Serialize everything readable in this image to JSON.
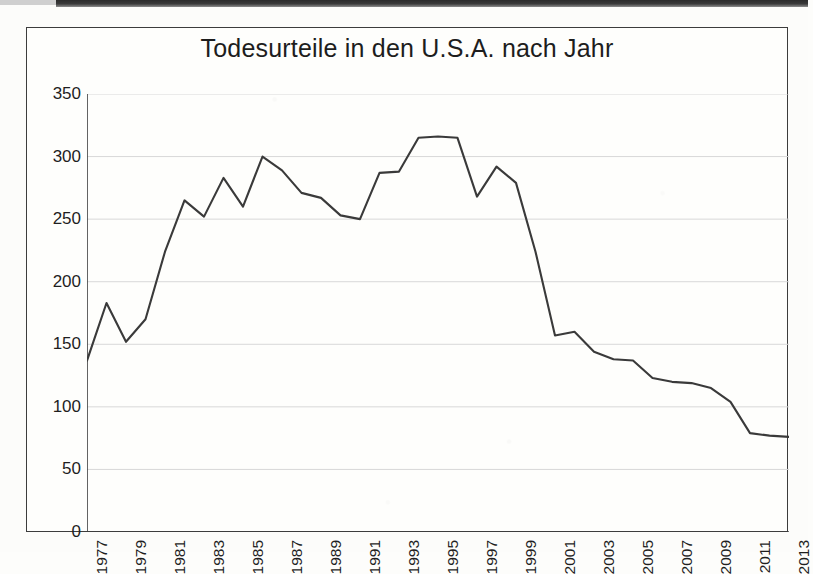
{
  "chart_data": {
    "type": "line",
    "title": "Todesurteile in den U.S.A. nach Jahr",
    "xlabel": "",
    "ylabel": "",
    "xlim": [
      1977,
      2013
    ],
    "ylim": [
      0,
      350
    ],
    "grid": true,
    "legend": false,
    "line_color": "#3a3a3a",
    "gridline_color": "#d8d8d8",
    "axis_color": "#3c3c3c",
    "yticks": [
      0,
      50,
      100,
      150,
      200,
      250,
      300,
      350
    ],
    "ytick_labels": [
      "0",
      "50",
      "100",
      "150",
      "200",
      "250",
      "300",
      "350"
    ],
    "xticks": [
      1977,
      1979,
      1981,
      1983,
      1985,
      1987,
      1989,
      1991,
      1993,
      1995,
      1997,
      1999,
      2001,
      2003,
      2005,
      2007,
      2009,
      2011,
      2013
    ],
    "xtick_labels": [
      "1977",
      "1979",
      "1981",
      "1983",
      "1985",
      "1987",
      "1989",
      "1991",
      "1993",
      "1995",
      "1997",
      "1999",
      "2001",
      "2003",
      "2005",
      "2007",
      "2009",
      "2011",
      "2013"
    ],
    "x": [
      1977,
      1978,
      1979,
      1980,
      1981,
      1982,
      1983,
      1984,
      1985,
      1986,
      1987,
      1988,
      1989,
      1990,
      1991,
      1992,
      1993,
      1994,
      1995,
      1996,
      1997,
      1998,
      1999,
      2000,
      2001,
      2002,
      2003,
      2004,
      2005,
      2006,
      2007,
      2008,
      2009,
      2010,
      2011,
      2012,
      2013
    ],
    "values": [
      137,
      183,
      152,
      170,
      224,
      265,
      252,
      283,
      260,
      300,
      289,
      271,
      267,
      253,
      250,
      287,
      288,
      315,
      316,
      315,
      268,
      292,
      279,
      224,
      157,
      160,
      144,
      138,
      137,
      123,
      120,
      119,
      115,
      104,
      79,
      77,
      76
    ],
    "series": [
      {
        "name": "Todesurteile",
        "values": [
          137,
          183,
          152,
          170,
          224,
          265,
          252,
          283,
          260,
          300,
          289,
          271,
          267,
          253,
          250,
          287,
          288,
          315,
          316,
          315,
          268,
          292,
          279,
          224,
          157,
          160,
          144,
          138,
          137,
          123,
          120,
          119,
          115,
          104,
          79,
          77,
          76
        ]
      }
    ]
  }
}
